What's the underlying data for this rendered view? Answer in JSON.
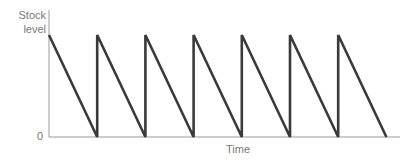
{
  "chart_data": {
    "type": "line",
    "title": "",
    "xlabel": "Time",
    "ylabel": "Stock level",
    "ytick_labels": [
      "0"
    ],
    "xtick_labels": [],
    "grid": false,
    "legend": null,
    "x": [
      0,
      1,
      1,
      2,
      2,
      3,
      3,
      4,
      4,
      5,
      5,
      6,
      6,
      7
    ],
    "y": [
      100,
      0,
      100,
      0,
      100,
      0,
      100,
      0,
      100,
      0,
      100,
      0,
      100,
      0
    ],
    "xlim": [
      0,
      7.3
    ],
    "ylim": [
      0,
      125
    ],
    "cycles": 7,
    "line_color": "#3a3a3a",
    "axis_color": "#9a9a9a"
  }
}
